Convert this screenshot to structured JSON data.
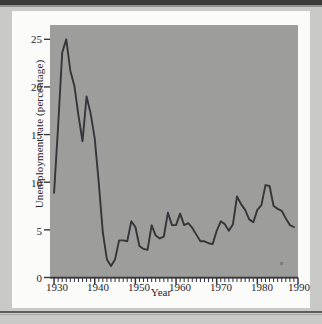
{
  "figure": {
    "plot_background_color": "#9d9d9b",
    "line_color": "#35353a",
    "card_background_color": "#fbfbfa",
    "page_background_color": "#c9c9c7"
  },
  "chart_data": {
    "type": "line",
    "title": "",
    "xlabel": "Year",
    "ylabel": "Unemployment rate (percentage)",
    "xlim": [
      1929,
      1990
    ],
    "ylim": [
      0,
      26.5
    ],
    "grid": false,
    "legend": "none",
    "xticks": [
      1930,
      1940,
      1950,
      1960,
      1970,
      1980,
      1990
    ],
    "xtick_labels": [
      "1930",
      "1940",
      "1950",
      "1960",
      "1970",
      "1980",
      "1990"
    ],
    "xminor_tick_interval": 1,
    "yticks": [
      0,
      5,
      10,
      15,
      20,
      25
    ],
    "ytick_labels": [
      "0",
      "5",
      "10",
      "15",
      "20",
      "25"
    ],
    "series": [
      {
        "name": "Unemployment rate",
        "x": [
          1930,
          1931,
          1932,
          1933,
          1934,
          1935,
          1936,
          1937,
          1938,
          1939,
          1940,
          1941,
          1942,
          1943,
          1944,
          1945,
          1946,
          1947,
          1948,
          1949,
          1950,
          1951,
          1952,
          1953,
          1954,
          1955,
          1956,
          1957,
          1958,
          1959,
          1960,
          1961,
          1962,
          1963,
          1964,
          1965,
          1966,
          1967,
          1968,
          1969,
          1970,
          1971,
          1972,
          1973,
          1974,
          1975,
          1976,
          1977,
          1978,
          1979,
          1980,
          1981,
          1982,
          1983,
          1984,
          1985,
          1986,
          1987,
          1988,
          1989
        ],
        "values": [
          8.9,
          15.9,
          23.6,
          25.0,
          21.7,
          20.1,
          17.0,
          14.3,
          19.0,
          17.2,
          14.6,
          9.9,
          4.7,
          1.9,
          1.2,
          1.9,
          3.9,
          3.9,
          3.8,
          5.9,
          5.3,
          3.3,
          3.0,
          2.9,
          5.5,
          4.4,
          4.1,
          4.3,
          6.8,
          5.5,
          5.5,
          6.7,
          5.5,
          5.7,
          5.2,
          4.5,
          3.8,
          3.8,
          3.6,
          3.5,
          4.9,
          5.9,
          5.6,
          4.9,
          5.6,
          8.5,
          7.7,
          7.1,
          6.1,
          5.8,
          7.1,
          7.6,
          9.7,
          9.6,
          7.5,
          7.2,
          7.0,
          6.2,
          5.5,
          5.3
        ]
      }
    ]
  }
}
